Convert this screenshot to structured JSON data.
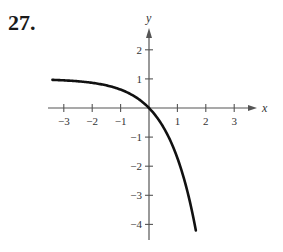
{
  "problem": {
    "number": "27."
  },
  "chart_data": {
    "type": "line",
    "title": "",
    "xlabel": "x",
    "ylabel": "y",
    "xlim": [
      -3.4,
      3.7
    ],
    "ylim": [
      -4.5,
      2.7
    ],
    "grid": false,
    "x_ticks": [
      -3,
      -2,
      -1,
      1,
      2,
      3
    ],
    "y_ticks": [
      2,
      1,
      -1,
      -2,
      -3,
      -4
    ],
    "x_tick_labels": [
      "−3",
      "−2",
      "−1",
      "1",
      "2",
      "3"
    ],
    "y_tick_labels": [
      "2",
      "1",
      "−1",
      "−2",
      "−3",
      "−4"
    ],
    "series": [
      {
        "name": "y = 1 − e^x",
        "x": [
          -3.4,
          -3,
          -2.5,
          -2,
          -1.5,
          -1,
          -0.5,
          0,
          0.25,
          0.5,
          0.75,
          1,
          1.25,
          1.5,
          1.65
        ],
        "y": [
          0.97,
          0.95,
          0.92,
          0.86,
          0.78,
          0.63,
          0.39,
          0,
          -0.28,
          -0.65,
          -1.12,
          -1.72,
          -2.49,
          -3.48,
          -4.21
        ]
      }
    ],
    "color": "#111111"
  }
}
